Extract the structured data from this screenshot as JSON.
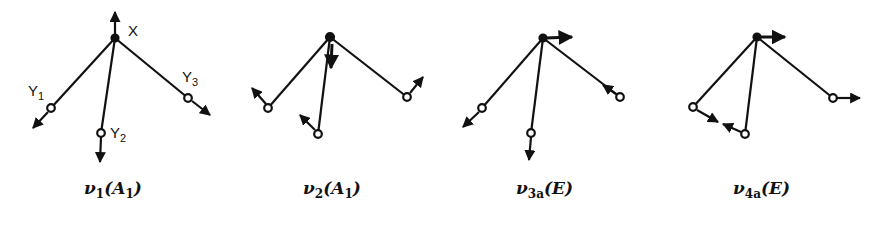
{
  "figure": {
    "atom_labels": {
      "central": "X",
      "y1": {
        "base": "Y",
        "sub": "1"
      },
      "y2": {
        "base": "Y",
        "sub": "2"
      },
      "y3": {
        "base": "Y",
        "sub": "3"
      }
    },
    "modes": [
      {
        "id": "v1",
        "symbol": "ν",
        "sub": "1",
        "symmetry": "A",
        "symmetry_sub": "1",
        "species_text": "ν1(A1)"
      },
      {
        "id": "v2",
        "symbol": "ν",
        "sub": "2",
        "symmetry": "A",
        "symmetry_sub": "1",
        "species_text": "ν2(A1)"
      },
      {
        "id": "v3a",
        "symbol": "ν",
        "sub": "3a",
        "symmetry": "E",
        "symmetry_sub": "",
        "species_text": "ν3a(E)"
      },
      {
        "id": "v4a",
        "symbol": "ν",
        "sub": "4a",
        "symmetry": "E",
        "symmetry_sub": "",
        "species_text": "ν4a(E)"
      }
    ],
    "colors": {
      "ink": "#111111",
      "background": "#ffffff"
    }
  }
}
